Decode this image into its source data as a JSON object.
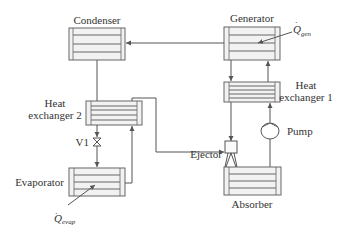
{
  "components": {
    "condenser": {
      "label": "Condenser"
    },
    "generator": {
      "label": "Generator",
      "heat_symbol": "Q",
      "heat_subscript": "gen"
    },
    "heat_exchanger_1": {
      "label_line1": "Heat",
      "label_line2": "exchanger 1"
    },
    "heat_exchanger_2": {
      "label_line1": "Heat",
      "label_line2": "exchanger 2"
    },
    "valve": {
      "label": "V1"
    },
    "evaporator": {
      "label": "Evaporator",
      "heat_symbol": "Q",
      "heat_subscript": "evap"
    },
    "ejector": {
      "label": "Ejector"
    },
    "pump": {
      "label": "Pump"
    },
    "absorber": {
      "label": "Absorber"
    }
  },
  "colors": {
    "line": "#555555",
    "box_fill": "#f2f2f2",
    "text": "#333333"
  }
}
